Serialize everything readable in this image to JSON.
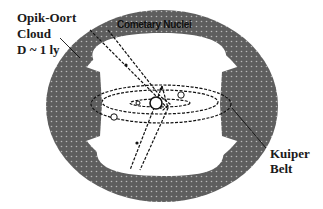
{
  "diagram": {
    "labels": {
      "oort_line1": "Opik-Oort",
      "oort_line2": "Cloud",
      "oort_line3": "D ~ 1 ly",
      "cometary_nuclei": "Cometary Nuclei",
      "kuiper_line1": "Kuiper",
      "kuiper_line2": "Belt"
    },
    "colors": {
      "cloud_fill": "#5e5e5e",
      "dot": "#b8b8b8",
      "line": "#111111",
      "background": "#ffffff"
    },
    "elements": [
      "oort-cloud-ring",
      "kuiper-belt-disk",
      "planetary-orbits",
      "comet-orbits",
      "sun"
    ]
  }
}
